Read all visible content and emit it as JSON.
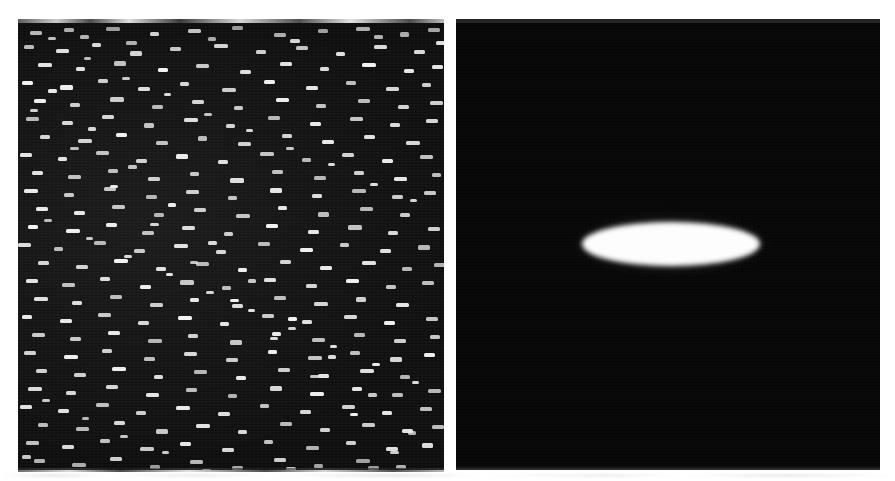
{
  "page": {
    "background_color": "#ffffff",
    "width": 895,
    "height": 481,
    "kind": "scanned-figure",
    "caption": ""
  },
  "figure": {
    "panel_count": 2,
    "panels": [
      {
        "id": "speckle",
        "name": "left-panel",
        "label": "",
        "x": 18,
        "y": 23,
        "width": 426,
        "height": 447,
        "background_color": "#0d0d0d",
        "foreground_color": "#f2f2f2",
        "content_type": "speckle-noise-field",
        "description": "Dense field of small bright horizontal dashes scattered on a near-black background"
      },
      {
        "id": "ellipse",
        "name": "right-panel",
        "label": "",
        "x": 456,
        "y": 23,
        "width": 424,
        "height": 445,
        "background_color": "#060606",
        "foreground_color": "#fdfdfd",
        "content_type": "single-bright-ellipse",
        "description": "Uniform near-black background with one soft-edged bright horizontal ellipse"
      }
    ]
  },
  "chart_data": {
    "type": "heatmap",
    "title": "",
    "xlabel": "",
    "ylabel": "",
    "panels": [
      {
        "name": "speckle-field",
        "colormap": "gray",
        "background_value": 0.05,
        "feature_value": 0.95,
        "feature_shape": "horizontal-dash",
        "feature_count": 430,
        "feature_width_px": [
          6,
          16
        ],
        "feature_height_px": [
          3,
          6
        ],
        "grid": false,
        "legend": "none"
      },
      {
        "name": "ellipse-field",
        "colormap": "gray",
        "background_value": 0.03,
        "feature_value": 0.99,
        "feature_shape": "ellipse",
        "feature_count": 1,
        "ellipse": {
          "center_x": 671,
          "center_y": 244,
          "semi_major_px": 89,
          "semi_minor_px": 22,
          "angle_deg": 0,
          "edge_softness_px": 3
        },
        "grid": false,
        "legend": "none"
      }
    ]
  },
  "artifacts": {
    "top_left_strip": "scan-edge-noise",
    "top_right_strip": "scan-edge-noise",
    "bottom_left_strip": "scan-edge-noise",
    "bottom_right_strip": "scan-edge-noise",
    "page_bottom_strip": "scan-edge-noise"
  },
  "speckles": [
    [
      12,
      8,
      12,
      4
    ],
    [
      46,
      5,
      10,
      4
    ],
    [
      88,
      4,
      14,
      4
    ],
    [
      132,
      9,
      9,
      4
    ],
    [
      170,
      6,
      13,
      4
    ],
    [
      214,
      3,
      11,
      4
    ],
    [
      256,
      10,
      12,
      4
    ],
    [
      300,
      6,
      10,
      4
    ],
    [
      338,
      4,
      14,
      4
    ],
    [
      382,
      9,
      9,
      5
    ],
    [
      410,
      5,
      12,
      4
    ],
    [
      6,
      22,
      10,
      4
    ],
    [
      38,
      26,
      13,
      4
    ],
    [
      74,
      20,
      9,
      4
    ],
    [
      112,
      28,
      12,
      5
    ],
    [
      152,
      24,
      11,
      4
    ],
    [
      196,
      21,
      14,
      4
    ],
    [
      238,
      27,
      10,
      4
    ],
    [
      278,
      23,
      12,
      4
    ],
    [
      318,
      29,
      9,
      4
    ],
    [
      356,
      22,
      13,
      4
    ],
    [
      396,
      27,
      11,
      4
    ],
    [
      20,
      40,
      14,
      4
    ],
    [
      58,
      44,
      9,
      4
    ],
    [
      96,
      38,
      12,
      5
    ],
    [
      140,
      45,
      10,
      4
    ],
    [
      178,
      41,
      13,
      4
    ],
    [
      222,
      47,
      11,
      4
    ],
    [
      262,
      39,
      12,
      4
    ],
    [
      302,
      44,
      9,
      4
    ],
    [
      344,
      40,
      14,
      4
    ],
    [
      386,
      46,
      10,
      4
    ],
    [
      414,
      42,
      11,
      4
    ],
    [
      4,
      58,
      11,
      4
    ],
    [
      42,
      62,
      13,
      5
    ],
    [
      80,
      56,
      10,
      4
    ],
    [
      120,
      64,
      12,
      4
    ],
    [
      162,
      59,
      9,
      4
    ],
    [
      204,
      65,
      14,
      4
    ],
    [
      246,
      57,
      11,
      4
    ],
    [
      288,
      63,
      12,
      4
    ],
    [
      328,
      58,
      10,
      4
    ],
    [
      368,
      64,
      13,
      4
    ],
    [
      404,
      60,
      9,
      4
    ],
    [
      16,
      76,
      12,
      4
    ],
    [
      52,
      80,
      10,
      4
    ],
    [
      92,
      74,
      14,
      5
    ],
    [
      134,
      82,
      11,
      4
    ],
    [
      174,
      77,
      12,
      4
    ],
    [
      216,
      83,
      9,
      4
    ],
    [
      258,
      75,
      13,
      4
    ],
    [
      298,
      81,
      10,
      4
    ],
    [
      340,
      76,
      12,
      4
    ],
    [
      380,
      82,
      11,
      4
    ],
    [
      412,
      78,
      13,
      4
    ],
    [
      8,
      94,
      13,
      4
    ],
    [
      44,
      98,
      11,
      4
    ],
    [
      84,
      92,
      12,
      4
    ],
    [
      126,
      100,
      10,
      5
    ],
    [
      166,
      95,
      14,
      4
    ],
    [
      208,
      101,
      9,
      4
    ],
    [
      250,
      93,
      12,
      4
    ],
    [
      292,
      99,
      11,
      4
    ],
    [
      332,
      94,
      13,
      4
    ],
    [
      372,
      100,
      10,
      4
    ],
    [
      408,
      96,
      12,
      4
    ],
    [
      22,
      112,
      10,
      4
    ],
    [
      60,
      116,
      14,
      4
    ],
    [
      98,
      110,
      11,
      4
    ],
    [
      138,
      118,
      12,
      4
    ],
    [
      180,
      113,
      9,
      5
    ],
    [
      220,
      119,
      13,
      4
    ],
    [
      264,
      111,
      10,
      4
    ],
    [
      304,
      117,
      12,
      4
    ],
    [
      346,
      112,
      11,
      4
    ],
    [
      388,
      118,
      14,
      4
    ],
    [
      2,
      130,
      12,
      4
    ],
    [
      40,
      134,
      9,
      4
    ],
    [
      78,
      128,
      13,
      4
    ],
    [
      118,
      136,
      11,
      4
    ],
    [
      158,
      131,
      12,
      5
    ],
    [
      200,
      137,
      10,
      4
    ],
    [
      242,
      129,
      14,
      4
    ],
    [
      284,
      135,
      9,
      4
    ],
    [
      324,
      130,
      12,
      4
    ],
    [
      364,
      136,
      11,
      4
    ],
    [
      402,
      132,
      13,
      4
    ],
    [
      14,
      148,
      11,
      4
    ],
    [
      50,
      152,
      13,
      4
    ],
    [
      90,
      146,
      10,
      4
    ],
    [
      130,
      154,
      12,
      4
    ],
    [
      172,
      149,
      9,
      4
    ],
    [
      212,
      155,
      14,
      5
    ],
    [
      254,
      147,
      11,
      4
    ],
    [
      296,
      153,
      12,
      4
    ],
    [
      336,
      148,
      10,
      4
    ],
    [
      376,
      154,
      13,
      4
    ],
    [
      414,
      150,
      9,
      4
    ],
    [
      6,
      166,
      14,
      4
    ],
    [
      46,
      170,
      10,
      4
    ],
    [
      86,
      164,
      12,
      4
    ],
    [
      128,
      172,
      11,
      4
    ],
    [
      168,
      167,
      13,
      4
    ],
    [
      210,
      173,
      9,
      4
    ],
    [
      252,
      165,
      12,
      5
    ],
    [
      294,
      171,
      10,
      4
    ],
    [
      334,
      166,
      14,
      4
    ],
    [
      374,
      172,
      11,
      4
    ],
    [
      406,
      168,
      12,
      4
    ],
    [
      18,
      184,
      12,
      4
    ],
    [
      56,
      188,
      11,
      4
    ],
    [
      94,
      182,
      13,
      4
    ],
    [
      136,
      190,
      10,
      4
    ],
    [
      176,
      185,
      12,
      4
    ],
    [
      218,
      191,
      14,
      4
    ],
    [
      260,
      183,
      9,
      4
    ],
    [
      300,
      189,
      11,
      5
    ],
    [
      342,
      184,
      13,
      4
    ],
    [
      382,
      190,
      10,
      4
    ],
    [
      10,
      202,
      10,
      4
    ],
    [
      48,
      206,
      14,
      4
    ],
    [
      88,
      200,
      11,
      4
    ],
    [
      124,
      208,
      12,
      4
    ],
    [
      164,
      203,
      13,
      4
    ],
    [
      206,
      209,
      9,
      4
    ],
    [
      248,
      201,
      12,
      4
    ],
    [
      290,
      207,
      11,
      4
    ],
    [
      330,
      202,
      14,
      5
    ],
    [
      370,
      208,
      10,
      4
    ],
    [
      410,
      204,
      12,
      4
    ],
    [
      0,
      220,
      13,
      4
    ],
    [
      36,
      224,
      9,
      4
    ],
    [
      76,
      218,
      12,
      4
    ],
    [
      116,
      226,
      11,
      4
    ],
    [
      156,
      221,
      14,
      4
    ],
    [
      198,
      227,
      10,
      4
    ],
    [
      240,
      219,
      12,
      4
    ],
    [
      282,
      225,
      13,
      4
    ],
    [
      322,
      220,
      9,
      4
    ],
    [
      362,
      226,
      11,
      4
    ],
    [
      400,
      222,
      12,
      5
    ],
    [
      20,
      238,
      11,
      4
    ],
    [
      58,
      242,
      12,
      4
    ],
    [
      96,
      236,
      14,
      4
    ],
    [
      138,
      244,
      10,
      4
    ],
    [
      178,
      239,
      13,
      4
    ],
    [
      220,
      245,
      9,
      4
    ],
    [
      262,
      237,
      11,
      4
    ],
    [
      302,
      243,
      12,
      4
    ],
    [
      344,
      238,
      14,
      4
    ],
    [
      384,
      244,
      10,
      4
    ],
    [
      416,
      240,
      12,
      4
    ],
    [
      8,
      256,
      12,
      4
    ],
    [
      44,
      260,
      13,
      4
    ],
    [
      82,
      254,
      10,
      4
    ],
    [
      122,
      262,
      11,
      4
    ],
    [
      162,
      257,
      14,
      5
    ],
    [
      204,
      263,
      9,
      4
    ],
    [
      246,
      255,
      12,
      4
    ],
    [
      288,
      261,
      11,
      4
    ],
    [
      328,
      256,
      13,
      4
    ],
    [
      368,
      262,
      10,
      4
    ],
    [
      404,
      258,
      12,
      4
    ],
    [
      16,
      274,
      14,
      4
    ],
    [
      54,
      278,
      10,
      4
    ],
    [
      92,
      272,
      12,
      4
    ],
    [
      132,
      280,
      13,
      4
    ],
    [
      172,
      275,
      9,
      4
    ],
    [
      214,
      281,
      11,
      4
    ],
    [
      256,
      273,
      12,
      4
    ],
    [
      296,
      279,
      14,
      4
    ],
    [
      338,
      274,
      10,
      5
    ],
    [
      378,
      280,
      13,
      4
    ],
    [
      4,
      292,
      10,
      4
    ],
    [
      42,
      296,
      12,
      4
    ],
    [
      80,
      290,
      13,
      4
    ],
    [
      120,
      298,
      11,
      4
    ],
    [
      160,
      293,
      14,
      4
    ],
    [
      202,
      299,
      9,
      4
    ],
    [
      244,
      291,
      12,
      4
    ],
    [
      284,
      297,
      10,
      4
    ],
    [
      326,
      292,
      13,
      4
    ],
    [
      366,
      298,
      11,
      4
    ],
    [
      408,
      294,
      12,
      4
    ],
    [
      14,
      310,
      13,
      4
    ],
    [
      52,
      314,
      11,
      4
    ],
    [
      90,
      308,
      12,
      4
    ],
    [
      130,
      316,
      14,
      4
    ],
    [
      170,
      311,
      10,
      4
    ],
    [
      212,
      317,
      12,
      5
    ],
    [
      254,
      309,
      9,
      4
    ],
    [
      294,
      315,
      13,
      4
    ],
    [
      336,
      310,
      11,
      4
    ],
    [
      376,
      316,
      12,
      4
    ],
    [
      412,
      312,
      10,
      4
    ],
    [
      6,
      328,
      12,
      4
    ],
    [
      46,
      332,
      14,
      4
    ],
    [
      84,
      326,
      10,
      4
    ],
    [
      126,
      334,
      11,
      4
    ],
    [
      166,
      329,
      13,
      4
    ],
    [
      208,
      335,
      12,
      4
    ],
    [
      250,
      327,
      9,
      4
    ],
    [
      290,
      333,
      14,
      4
    ],
    [
      332,
      328,
      10,
      4
    ],
    [
      372,
      334,
      12,
      5
    ],
    [
      406,
      330,
      11,
      4
    ],
    [
      18,
      346,
      11,
      4
    ],
    [
      56,
      350,
      12,
      4
    ],
    [
      94,
      344,
      14,
      4
    ],
    [
      136,
      352,
      9,
      4
    ],
    [
      176,
      347,
      13,
      4
    ],
    [
      218,
      353,
      10,
      4
    ],
    [
      260,
      345,
      12,
      4
    ],
    [
      300,
      351,
      11,
      4
    ],
    [
      342,
      346,
      14,
      4
    ],
    [
      382,
      352,
      10,
      4
    ],
    [
      10,
      364,
      14,
      4
    ],
    [
      48,
      368,
      10,
      4
    ],
    [
      88,
      362,
      12,
      4
    ],
    [
      128,
      370,
      13,
      4
    ],
    [
      168,
      365,
      11,
      4
    ],
    [
      210,
      371,
      9,
      4
    ],
    [
      252,
      363,
      12,
      5
    ],
    [
      292,
      369,
      14,
      4
    ],
    [
      334,
      364,
      10,
      4
    ],
    [
      374,
      370,
      11,
      4
    ],
    [
      410,
      366,
      13,
      4
    ],
    [
      2,
      382,
      12,
      4
    ],
    [
      40,
      386,
      11,
      4
    ],
    [
      78,
      380,
      13,
      4
    ],
    [
      118,
      388,
      10,
      4
    ],
    [
      158,
      383,
      14,
      4
    ],
    [
      200,
      389,
      12,
      4
    ],
    [
      242,
      381,
      9,
      4
    ],
    [
      282,
      387,
      11,
      4
    ],
    [
      324,
      382,
      13,
      4
    ],
    [
      364,
      388,
      10,
      4
    ],
    [
      402,
      384,
      12,
      4
    ],
    [
      20,
      400,
      10,
      4
    ],
    [
      58,
      404,
      13,
      4
    ],
    [
      96,
      398,
      11,
      4
    ],
    [
      138,
      406,
      12,
      5
    ],
    [
      178,
      401,
      14,
      4
    ],
    [
      220,
      407,
      9,
      4
    ],
    [
      262,
      399,
      12,
      4
    ],
    [
      302,
      405,
      10,
      4
    ],
    [
      344,
      400,
      13,
      4
    ],
    [
      384,
      406,
      11,
      4
    ],
    [
      414,
      402,
      12,
      4
    ],
    [
      8,
      418,
      13,
      4
    ],
    [
      44,
      422,
      12,
      4
    ],
    [
      82,
      416,
      10,
      4
    ],
    [
      122,
      424,
      14,
      4
    ],
    [
      162,
      419,
      11,
      4
    ],
    [
      204,
      425,
      12,
      4
    ],
    [
      246,
      417,
      9,
      4
    ],
    [
      288,
      423,
      13,
      4
    ],
    [
      328,
      418,
      10,
      4
    ],
    [
      368,
      424,
      12,
      4
    ],
    [
      404,
      420,
      11,
      5
    ],
    [
      16,
      436,
      11,
      4
    ],
    [
      54,
      440,
      14,
      4
    ],
    [
      92,
      434,
      12,
      4
    ],
    [
      132,
      442,
      10,
      4
    ],
    [
      172,
      437,
      13,
      4
    ],
    [
      214,
      443,
      11,
      4
    ],
    [
      256,
      435,
      12,
      4
    ],
    [
      296,
      441,
      9,
      4
    ],
    [
      338,
      436,
      14,
      4
    ],
    [
      378,
      442,
      10,
      4
    ],
    [
      4,
      432,
      9,
      4
    ],
    [
      30,
      14,
      8,
      3
    ],
    [
      66,
      34,
      7,
      3
    ],
    [
      104,
      54,
      8,
      3
    ],
    [
      146,
      70,
      7,
      3
    ],
    [
      186,
      90,
      8,
      3
    ],
    [
      228,
      106,
      7,
      3
    ],
    [
      268,
      124,
      8,
      3
    ],
    [
      310,
      140,
      7,
      3
    ],
    [
      352,
      160,
      8,
      3
    ],
    [
      392,
      176,
      7,
      3
    ],
    [
      26,
      196,
      8,
      3
    ],
    [
      68,
      214,
      7,
      3
    ],
    [
      106,
      232,
      8,
      3
    ],
    [
      148,
      250,
      7,
      3
    ],
    [
      188,
      268,
      8,
      3
    ],
    [
      230,
      286,
      7,
      3
    ],
    [
      270,
      304,
      8,
      3
    ],
    [
      312,
      322,
      7,
      3
    ],
    [
      354,
      340,
      8,
      3
    ],
    [
      394,
      358,
      7,
      3
    ],
    [
      24,
      376,
      8,
      3
    ],
    [
      64,
      394,
      7,
      3
    ],
    [
      102,
      412,
      8,
      3
    ],
    [
      144,
      428,
      7,
      3
    ],
    [
      184,
      446,
      9,
      4
    ],
    [
      226,
      450,
      8,
      4
    ],
    [
      268,
      444,
      10,
      4
    ],
    [
      308,
      448,
      9,
      4
    ],
    [
      350,
      443,
      11,
      4
    ],
    [
      390,
      449,
      8,
      4
    ],
    [
      34,
      452,
      10,
      4
    ],
    [
      74,
      456,
      9,
      4
    ],
    [
      114,
      450,
      12,
      4
    ],
    [
      154,
      458,
      8,
      4
    ],
    [
      194,
      455,
      10,
      4
    ],
    [
      236,
      459,
      9,
      4
    ],
    [
      276,
      452,
      11,
      4
    ],
    [
      316,
      458,
      8,
      4
    ],
    [
      358,
      453,
      10,
      4
    ],
    [
      398,
      459,
      9,
      4
    ],
    [
      62,
      12,
      9,
      4
    ],
    [
      108,
      18,
      11,
      4
    ],
    [
      190,
      14,
      8,
      4
    ],
    [
      272,
      16,
      10,
      4
    ],
    [
      356,
      12,
      9,
      4
    ],
    [
      418,
      18,
      11,
      4
    ],
    [
      30,
      66,
      9,
      4
    ],
    [
      70,
      104,
      8,
      4
    ],
    [
      110,
      142,
      9,
      4
    ],
    [
      150,
      180,
      8,
      4
    ],
    [
      190,
      218,
      9,
      4
    ],
    [
      230,
      256,
      8,
      4
    ],
    [
      270,
      294,
      9,
      4
    ],
    [
      310,
      332,
      8,
      4
    ],
    [
      350,
      370,
      9,
      4
    ],
    [
      390,
      408,
      8,
      4
    ],
    [
      12,
      86,
      8,
      3
    ],
    [
      52,
      124,
      9,
      3
    ],
    [
      92,
      162,
      8,
      3
    ],
    [
      132,
      200,
      9,
      3
    ],
    [
      172,
      238,
      8,
      3
    ],
    [
      212,
      276,
      9,
      3
    ],
    [
      252,
      314,
      8,
      3
    ],
    [
      292,
      352,
      9,
      3
    ],
    [
      332,
      390,
      8,
      3
    ],
    [
      372,
      428,
      9,
      3
    ]
  ]
}
